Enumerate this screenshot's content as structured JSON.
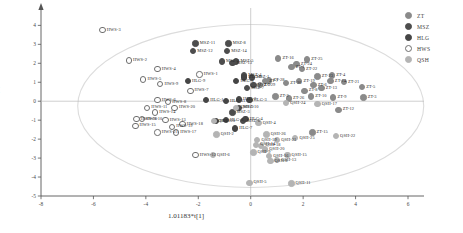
{
  "chart_data": {
    "type": "scatter",
    "title": "",
    "xlabel": "1.01183*t[1]",
    "ylabel": "1.02991*t[2]",
    "xlim": [
      -8,
      6
    ],
    "ylim": [
      -5,
      4.6
    ],
    "xticks": [
      -8,
      -6,
      -4,
      -2,
      0,
      2,
      4,
      6
    ],
    "yticks": [
      4,
      3,
      2,
      1,
      0,
      -1,
      -2,
      -3,
      -4,
      -5
    ],
    "grid": false,
    "legend_position": "right",
    "ellipse": {
      "cx": 0.0,
      "cy": -0.25,
      "rx": 6.6,
      "ry": 4.3,
      "label": "hotellings-t2-ellipse"
    },
    "series": [
      {
        "name": "ZT",
        "color": "#8a8a8a",
        "marker": "filled-circle",
        "points": [
          {
            "label": "ZT-16",
            "x": 1.05,
            "y": 2.25
          },
          {
            "label": "ZT-25",
            "x": 2.15,
            "y": 2.2
          },
          {
            "label": "ZT-24",
            "x": 1.75,
            "y": 1.95
          },
          {
            "label": "ZT-22",
            "x": 1.95,
            "y": 1.7
          },
          {
            "label": "ZT-1",
            "x": 1.55,
            "y": 1.8
          },
          {
            "label": "ZT-4",
            "x": 3.1,
            "y": 1.35
          },
          {
            "label": "ZT-23",
            "x": 2.55,
            "y": 1.3
          },
          {
            "label": "ZT-21",
            "x": 3.55,
            "y": 1.0
          },
          {
            "label": "ZT-14",
            "x": 3.05,
            "y": 1.05
          },
          {
            "label": "ZT-5",
            "x": 4.25,
            "y": 0.75
          },
          {
            "label": "ZT-3",
            "x": 4.3,
            "y": 0.2
          },
          {
            "label": "ZT-9",
            "x": 3.15,
            "y": 0.2
          },
          {
            "label": "ZT-12",
            "x": 3.35,
            "y": -0.45
          },
          {
            "label": "ZT-29",
            "x": 0.35,
            "y": 0.85
          },
          {
            "label": "ZT-28",
            "x": 0.7,
            "y": 1.1
          },
          {
            "label": "ZT-15",
            "x": 2.35,
            "y": -1.65
          },
          {
            "label": "ZT-7",
            "x": 0.55,
            "y": 1.05
          },
          {
            "label": "ZT-20",
            "x": 1.35,
            "y": 0.95
          },
          {
            "label": "ZT-19",
            "x": 1.85,
            "y": 1.05
          },
          {
            "label": "ZT-6",
            "x": 2.4,
            "y": 0.85
          },
          {
            "label": "ZT-26",
            "x": 1.45,
            "y": 0.15
          },
          {
            "label": "ZT-8",
            "x": 2.05,
            "y": 0.55
          },
          {
            "label": "ZT-13",
            "x": 2.7,
            "y": 0.7
          },
          {
            "label": "ZT-10",
            "x": 2.3,
            "y": 0.25
          },
          {
            "label": "ZT-2",
            "x": 0.95,
            "y": 0.25
          }
        ]
      },
      {
        "name": "MSZ",
        "color": "#4d4d4d",
        "marker": "filled-circle",
        "points": [
          {
            "label": "MSZ-11",
            "x": -2.1,
            "y": 3.05
          },
          {
            "label": "MSZ-8",
            "x": -0.85,
            "y": 3.05
          },
          {
            "label": "MSZ-12",
            "x": -2.2,
            "y": 2.65
          },
          {
            "label": "MSZ-14",
            "x": -0.9,
            "y": 2.65
          },
          {
            "label": "MSZ-5",
            "x": -0.55,
            "y": 2.1
          },
          {
            "label": "MSZ-9",
            "x": -1.1,
            "y": 2.1
          },
          {
            "label": "MSZ-13",
            "x": -0.7,
            "y": 2.0
          },
          {
            "label": "MSZ-4",
            "x": -0.25,
            "y": 1.35
          },
          {
            "label": "MSZ-1",
            "x": 0.05,
            "y": 1.25
          },
          {
            "label": "MSZ-2",
            "x": 0.1,
            "y": 0.85
          },
          {
            "label": "MSZ-7",
            "x": -0.15,
            "y": 0.7
          },
          {
            "label": "MSZ-3",
            "x": -0.7,
            "y": -0.6
          },
          {
            "label": "MSZ-6",
            "x": -0.3,
            "y": -1.05
          },
          {
            "label": "MSZ-10",
            "x": -0.45,
            "y": -0.35
          }
        ]
      },
      {
        "name": "HLG",
        "color": "#454545",
        "marker": "filled-circle",
        "points": [
          {
            "label": "HLG-9",
            "x": -2.4,
            "y": 1.05
          },
          {
            "label": "HLG-8",
            "x": -0.25,
            "y": 1.25
          },
          {
            "label": "HLG-5",
            "x": -0.55,
            "y": 1.05
          },
          {
            "label": "HLG-1",
            "x": -1.7,
            "y": 0.05
          },
          {
            "label": "HLG-2",
            "x": -0.45,
            "y": 0.1
          },
          {
            "label": "HLG-11",
            "x": -0.95,
            "y": 0.0
          },
          {
            "label": "HLG-3",
            "x": -0.05,
            "y": 0.05
          },
          {
            "label": "HLG-6",
            "x": -0.95,
            "y": -1.0
          },
          {
            "label": "HLG-10",
            "x": -1.35,
            "y": -1.05
          },
          {
            "label": "HLG-4",
            "x": -0.2,
            "y": -0.95
          },
          {
            "label": "HLG-7",
            "x": -0.6,
            "y": -1.45
          }
        ]
      },
      {
        "name": "HWS",
        "color": "#ffffff",
        "marker": "open-circle",
        "points": [
          {
            "label": "HWS-3",
            "x": -5.65,
            "y": 3.75
          },
          {
            "label": "HWS-2",
            "x": -4.65,
            "y": 2.15
          },
          {
            "label": "HWS-4",
            "x": -3.55,
            "y": 1.7
          },
          {
            "label": "HWS-5",
            "x": -4.1,
            "y": 1.15
          },
          {
            "label": "HWS-9",
            "x": -3.45,
            "y": 0.9
          },
          {
            "label": "HWS-1",
            "x": -1.95,
            "y": 1.4
          },
          {
            "label": "HWS-7",
            "x": -2.3,
            "y": 0.55
          },
          {
            "label": "HWS-6",
            "x": -3.55,
            "y": 0.05
          },
          {
            "label": "HWS-8",
            "x": -3.15,
            "y": -0.05
          },
          {
            "label": "HWS-20",
            "x": -2.9,
            "y": -0.35
          },
          {
            "label": "HWS-11",
            "x": -3.95,
            "y": -0.35
          },
          {
            "label": "HWS-14",
            "x": -3.65,
            "y": -0.6
          },
          {
            "label": "HWS-16",
            "x": -4.35,
            "y": -0.95
          },
          {
            "label": "HWS-10",
            "x": -4.15,
            "y": -0.95
          },
          {
            "label": "HWS-13",
            "x": -3.25,
            "y": -1.0
          },
          {
            "label": "HWS-15",
            "x": -4.4,
            "y": -1.3
          },
          {
            "label": "HWS-19",
            "x": -3.0,
            "y": -1.35
          },
          {
            "label": "HWS-18",
            "x": -2.6,
            "y": -1.2
          },
          {
            "label": "HWS-17",
            "x": -2.85,
            "y": -1.65
          },
          {
            "label": "HWS-21",
            "x": -3.55,
            "y": -1.65
          },
          {
            "label": "HWS-12",
            "x": -2.1,
            "y": -2.85
          }
        ]
      },
      {
        "name": "QSH",
        "color": "#b4b4b4",
        "marker": "filled-circle",
        "points": [
          {
            "label": "QSH-3",
            "x": -0.55,
            "y": -0.35
          },
          {
            "label": "QSH-1",
            "x": -1.4,
            "y": -1.05
          },
          {
            "label": "QSH-2",
            "x": -1.3,
            "y": -1.75
          },
          {
            "label": "QSH-4",
            "x": 0.3,
            "y": -1.15
          },
          {
            "label": "QSH-26",
            "x": 0.6,
            "y": -1.75
          },
          {
            "label": "QSH-19",
            "x": 0.25,
            "y": -2.05
          },
          {
            "label": "QSH-21",
            "x": 1.0,
            "y": -2.05
          },
          {
            "label": "QSH-25",
            "x": 1.7,
            "y": -1.95
          },
          {
            "label": "QSH-22",
            "x": 3.25,
            "y": -1.85
          },
          {
            "label": "QSH-18",
            "x": 0.4,
            "y": -2.35
          },
          {
            "label": "QSH-14",
            "x": 0.2,
            "y": -2.3
          },
          {
            "label": "QSH-20",
            "x": 0.55,
            "y": -2.55
          },
          {
            "label": "QSH-9",
            "x": 0.1,
            "y": -2.7
          },
          {
            "label": "QSH-16",
            "x": 0.7,
            "y": -2.9
          },
          {
            "label": "QSH-15",
            "x": 1.4,
            "y": -2.85
          },
          {
            "label": "QSH-13",
            "x": 1.0,
            "y": -3.1
          },
          {
            "label": "QSH-8",
            "x": 0.75,
            "y": -3.15
          },
          {
            "label": "QSH-6",
            "x": -1.45,
            "y": -2.85
          },
          {
            "label": "QSH-17",
            "x": 2.55,
            "y": -0.15
          },
          {
            "label": "QSH-24",
            "x": 1.35,
            "y": -0.1
          },
          {
            "label": "QSH-5",
            "x": -0.05,
            "y": -4.3
          },
          {
            "label": "QSH-11",
            "x": 1.55,
            "y": -4.35
          }
        ]
      }
    ]
  },
  "legend": {
    "items": [
      {
        "name": "ZT"
      },
      {
        "name": "MSZ"
      },
      {
        "name": "HLG"
      },
      {
        "name": "HWS"
      },
      {
        "name": "QSH"
      }
    ]
  }
}
